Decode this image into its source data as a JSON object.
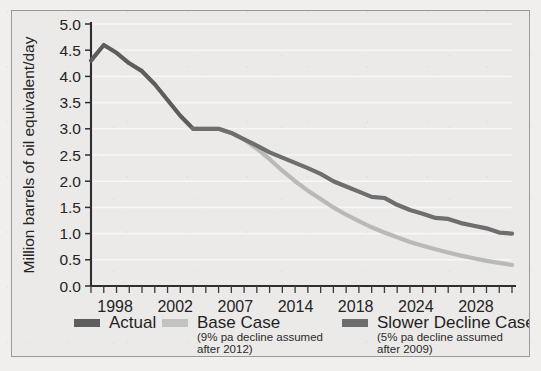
{
  "figure": {
    "background_color": "#eceae9",
    "frame_color": "#9a9a98",
    "axis_color": "#2e2e2e"
  },
  "chart_data": {
    "type": "line",
    "title": "",
    "subtitle": "",
    "xlabel": "",
    "ylabel": "Million barrels of oil equivalent/day",
    "xlim": [
      1998,
      2031
    ],
    "ylim": [
      0.0,
      5.0
    ],
    "grid": true,
    "grid_axis": "y",
    "legend_position": "bottom",
    "ytick_labels": [
      "0.0",
      "0.5",
      "1.0",
      "1.5",
      "2.0",
      "2.5",
      "3.0",
      "3.5",
      "4.0",
      "4.5",
      "5.0"
    ],
    "ytick_values": [
      0.0,
      0.5,
      1.0,
      1.5,
      2.0,
      2.5,
      3.0,
      3.5,
      4.0,
      4.5,
      5.0
    ],
    "xtick_labels": [
      "1998",
      "2002",
      "2007",
      "2014",
      "2018",
      "2024",
      "2028"
    ],
    "xtick_values": [
      1998,
      2002,
      2007,
      2014,
      2018,
      2024,
      2028
    ],
    "xtick_minor_step": 1,
    "series": [
      {
        "name": "Actual",
        "color": "#5d5d5d",
        "linewidth": 4.2,
        "x": [
          1998,
          1999,
          2000,
          2001,
          2002,
          2003,
          2004,
          2005,
          2006
        ],
        "values": [
          4.3,
          4.6,
          4.45,
          4.25,
          4.1,
          3.85,
          3.55,
          3.25,
          3.0
        ]
      },
      {
        "name": "Base Case",
        "color": "#b9b9b7",
        "linewidth": 4.2,
        "x": [
          2006,
          2007,
          2008,
          2009,
          2010,
          2011,
          2012,
          2013,
          2014,
          2015,
          2016,
          2017,
          2018,
          2019,
          2020,
          2021,
          2022,
          2023,
          2024,
          2025,
          2026,
          2027,
          2028,
          2029,
          2030,
          2031
        ],
        "values": [
          3.0,
          3.0,
          3.0,
          2.92,
          2.8,
          2.62,
          2.42,
          2.2,
          2.0,
          1.82,
          1.66,
          1.5,
          1.36,
          1.24,
          1.12,
          1.02,
          0.93,
          0.84,
          0.77,
          0.7,
          0.64,
          0.58,
          0.53,
          0.48,
          0.44,
          0.4
        ]
      },
      {
        "name": "Slower Decline Case",
        "color": "#6e6e6e",
        "linewidth": 4.2,
        "x": [
          2006,
          2007,
          2008,
          2009,
          2010,
          2011,
          2012,
          2013,
          2014,
          2015,
          2016,
          2017,
          2018,
          2019,
          2020,
          2021,
          2022,
          2023,
          2024,
          2025,
          2026,
          2027,
          2028,
          2029,
          2030,
          2031
        ],
        "values": [
          3.0,
          3.0,
          3.0,
          2.92,
          2.8,
          2.68,
          2.55,
          2.45,
          2.35,
          2.25,
          2.14,
          2.0,
          1.9,
          1.8,
          1.7,
          1.68,
          1.55,
          1.45,
          1.38,
          1.3,
          1.28,
          1.2,
          1.15,
          1.1,
          1.02,
          1.0
        ]
      }
    ],
    "legend": [
      {
        "label": "Actual",
        "note_line1": "",
        "note_line2": "",
        "color": "#5d5d5d"
      },
      {
        "label": "Base Case",
        "note_line1": "(9% pa decline assumed",
        "note_line2": "after 2012)",
        "color": "#c3c3c1"
      },
      {
        "label": "Slower Decline Case",
        "note_line1": "(5% pa decline assumed",
        "note_line2": "after 2009)",
        "color": "#6e6e6e"
      }
    ]
  }
}
